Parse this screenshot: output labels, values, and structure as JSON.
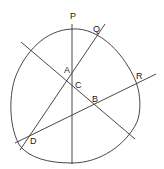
{
  "diagram": {
    "title": "",
    "labels": {
      "P": "P",
      "Q": "Q",
      "R": "R",
      "A": "A",
      "B": "B",
      "C": "C",
      "D": "D"
    },
    "colors": {
      "stroke": "#333333",
      "background": "#ffffff"
    }
  }
}
